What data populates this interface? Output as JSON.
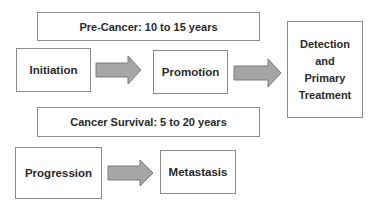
{
  "diagram": {
    "banners": {
      "pre_cancer": "Pre-Cancer: 10 to 15 years",
      "survival": "Cancer Survival: 5 to 20 years"
    },
    "stages": {
      "initiation": "Initiation",
      "promotion": "Promotion",
      "detection": [
        "Detection",
        "and",
        "Primary",
        "Treatment"
      ],
      "progression": "Progression",
      "metastasis": "Metastasis"
    },
    "arrows": [
      {
        "from": "Initiation",
        "to": "Promotion"
      },
      {
        "from": "Promotion",
        "to": "Detection and Primary Treatment"
      },
      {
        "from": "Progression",
        "to": "Metastasis"
      }
    ],
    "colors": {
      "border": "#8a8a8a",
      "arrow_fill": "#a6a6a6",
      "arrow_stroke": "#7a7a7a",
      "text": "#2a2a2a"
    }
  }
}
